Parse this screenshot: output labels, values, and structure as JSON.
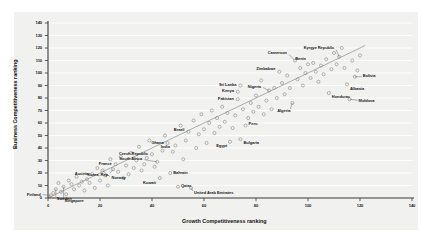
{
  "chart_data": {
    "type": "scatter",
    "title": "",
    "xlabel": "Growth Competitiveness ranking",
    "ylabel": "Business Competitiveness ranking",
    "xlim": [
      0,
      140
    ],
    "ylim": [
      0,
      140
    ],
    "xticks": [
      0,
      20,
      40,
      60,
      80,
      100,
      120,
      140
    ],
    "yticks": [
      0,
      10,
      20,
      30,
      40,
      50,
      60,
      70,
      80,
      90,
      100,
      110,
      120,
      130,
      140
    ],
    "grid": "horizontal",
    "legend": "none",
    "marker": "open-circle",
    "trendline": {
      "present": true,
      "x0": 0,
      "y0": 0,
      "x1": 122,
      "y1": 122
    },
    "labeled_points": [
      {
        "name": "Finland",
        "x": 1,
        "y": 2
      },
      {
        "name": "Singapore",
        "x": 6,
        "y": 9
      },
      {
        "name": "Sweden",
        "x": 3,
        "y": 7
      },
      {
        "name": "Norway",
        "x": 21,
        "y": 22
      },
      {
        "name": "France",
        "x": 26,
        "y": 27
      },
      {
        "name": "Austria",
        "x": 17,
        "y": 19
      },
      {
        "name": "Czech Republic",
        "x": 40,
        "y": 35
      },
      {
        "name": "South Africa",
        "x": 42,
        "y": 29
      },
      {
        "name": "India",
        "x": 48,
        "y": 37
      },
      {
        "name": "Korea, Rep.",
        "x": 25,
        "y": 23
      },
      {
        "name": "Kuwait",
        "x": 43,
        "y": 16
      },
      {
        "name": "Bahrain",
        "x": 47,
        "y": 20
      },
      {
        "name": "Qatar",
        "x": 50,
        "y": 9
      },
      {
        "name": "United Arab Emirates",
        "x": 55,
        "y": 8
      },
      {
        "name": "Ghana",
        "x": 46,
        "y": 44
      },
      {
        "name": "Brazil",
        "x": 54,
        "y": 53
      },
      {
        "name": "Egypt",
        "x": 70,
        "y": 45
      },
      {
        "name": "Bulgaria",
        "x": 74,
        "y": 47
      },
      {
        "name": "Peru",
        "x": 76,
        "y": 58
      },
      {
        "name": "Pakistan",
        "x": 73,
        "y": 79
      },
      {
        "name": "Kenya",
        "x": 73,
        "y": 85
      },
      {
        "name": "Sri Lanka",
        "x": 74,
        "y": 90
      },
      {
        "name": "Nigeria",
        "x": 85,
        "y": 86
      },
      {
        "name": "Zimbabwe",
        "x": 89,
        "y": 101
      },
      {
        "name": "Cameroon",
        "x": 95,
        "y": 110
      },
      {
        "name": "Benin",
        "x": 100,
        "y": 107
      },
      {
        "name": "Kyrgyz Republic",
        "x": 112,
        "y": 113
      },
      {
        "name": "Bolivia",
        "x": 118,
        "y": 97
      },
      {
        "name": "Albania",
        "x": 115,
        "y": 91
      },
      {
        "name": "Honduras",
        "x": 108,
        "y": 84
      },
      {
        "name": "Moldova",
        "x": 116,
        "y": 79
      },
      {
        "name": "Algeria",
        "x": 94,
        "y": 76
      }
    ],
    "unlabeled_points": [
      {
        "x": 2,
        "y": 4
      },
      {
        "x": 4,
        "y": 12
      },
      {
        "x": 5,
        "y": 5
      },
      {
        "x": 7,
        "y": 3
      },
      {
        "x": 8,
        "y": 14
      },
      {
        "x": 9,
        "y": 11
      },
      {
        "x": 10,
        "y": 7
      },
      {
        "x": 11,
        "y": 17
      },
      {
        "x": 12,
        "y": 10
      },
      {
        "x": 13,
        "y": 13
      },
      {
        "x": 14,
        "y": 6
      },
      {
        "x": 15,
        "y": 15
      },
      {
        "x": 16,
        "y": 12
      },
      {
        "x": 18,
        "y": 8
      },
      {
        "x": 19,
        "y": 24
      },
      {
        "x": 20,
        "y": 14
      },
      {
        "x": 22,
        "y": 18
      },
      {
        "x": 23,
        "y": 10
      },
      {
        "x": 24,
        "y": 31
      },
      {
        "x": 27,
        "y": 21
      },
      {
        "x": 28,
        "y": 33
      },
      {
        "x": 29,
        "y": 16
      },
      {
        "x": 30,
        "y": 26
      },
      {
        "x": 31,
        "y": 19
      },
      {
        "x": 32,
        "y": 36
      },
      {
        "x": 33,
        "y": 24
      },
      {
        "x": 34,
        "y": 30
      },
      {
        "x": 35,
        "y": 41
      },
      {
        "x": 36,
        "y": 22
      },
      {
        "x": 37,
        "y": 27
      },
      {
        "x": 38,
        "y": 32
      },
      {
        "x": 39,
        "y": 46
      },
      {
        "x": 41,
        "y": 25
      },
      {
        "x": 44,
        "y": 38
      },
      {
        "x": 45,
        "y": 50
      },
      {
        "x": 49,
        "y": 42
      },
      {
        "x": 51,
        "y": 58
      },
      {
        "x": 52,
        "y": 31
      },
      {
        "x": 53,
        "y": 46
      },
      {
        "x": 56,
        "y": 62
      },
      {
        "x": 57,
        "y": 40
      },
      {
        "x": 58,
        "y": 51
      },
      {
        "x": 59,
        "y": 67
      },
      {
        "x": 60,
        "y": 55
      },
      {
        "x": 61,
        "y": 44
      },
      {
        "x": 62,
        "y": 60
      },
      {
        "x": 63,
        "y": 70
      },
      {
        "x": 64,
        "y": 52
      },
      {
        "x": 65,
        "y": 64
      },
      {
        "x": 66,
        "y": 57
      },
      {
        "x": 67,
        "y": 73
      },
      {
        "x": 68,
        "y": 61
      },
      {
        "x": 69,
        "y": 68
      },
      {
        "x": 71,
        "y": 56
      },
      {
        "x": 72,
        "y": 66
      },
      {
        "x": 75,
        "y": 71
      },
      {
        "x": 77,
        "y": 64
      },
      {
        "x": 78,
        "y": 76
      },
      {
        "x": 79,
        "y": 69
      },
      {
        "x": 80,
        "y": 82
      },
      {
        "x": 81,
        "y": 73
      },
      {
        "x": 82,
        "y": 94
      },
      {
        "x": 83,
        "y": 67
      },
      {
        "x": 84,
        "y": 78
      },
      {
        "x": 86,
        "y": 71
      },
      {
        "x": 87,
        "y": 88
      },
      {
        "x": 88,
        "y": 80
      },
      {
        "x": 90,
        "y": 92
      },
      {
        "x": 91,
        "y": 83
      },
      {
        "x": 92,
        "y": 98
      },
      {
        "x": 93,
        "y": 88
      },
      {
        "x": 96,
        "y": 95
      },
      {
        "x": 97,
        "y": 104
      },
      {
        "x": 98,
        "y": 90
      },
      {
        "x": 99,
        "y": 100
      },
      {
        "x": 101,
        "y": 96
      },
      {
        "x": 102,
        "y": 108
      },
      {
        "x": 103,
        "y": 101
      },
      {
        "x": 104,
        "y": 93
      },
      {
        "x": 105,
        "y": 106
      },
      {
        "x": 106,
        "y": 99
      },
      {
        "x": 107,
        "y": 111
      },
      {
        "x": 109,
        "y": 103
      },
      {
        "x": 110,
        "y": 116
      },
      {
        "x": 111,
        "y": 107
      },
      {
        "x": 113,
        "y": 120
      },
      {
        "x": 114,
        "y": 104
      },
      {
        "x": 117,
        "y": 110
      },
      {
        "x": 119,
        "y": 102
      },
      {
        "x": 120,
        "y": 114
      }
    ]
  },
  "colors": {
    "panel_background": "#f1f1ef",
    "gridline": "#ffffff",
    "axis": "#3b3b3b",
    "marker_stroke": "#8f8f8f",
    "trendline": "#9a9a9a",
    "text": "#1b1b1b"
  }
}
